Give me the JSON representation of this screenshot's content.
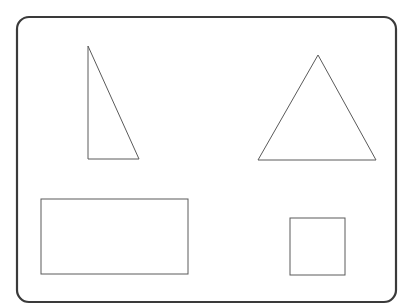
{
  "diagram": {
    "width": 413,
    "height": 308,
    "background": "#ffffff",
    "frame": {
      "x": 17,
      "y": 17,
      "width": 379,
      "height": 285,
      "radius": 12,
      "stroke": "#3a3a3a"
    },
    "shapes": [
      {
        "id": "right-triangle",
        "type": "polygon",
        "points": "88,46 88,159 139,159",
        "stroke": "#5a5a5a"
      },
      {
        "id": "equilateral-triangle",
        "type": "polygon",
        "points": "318,55 258,160 376,160",
        "stroke": "#5a5a5a"
      },
      {
        "id": "rectangle",
        "type": "rect",
        "x": 41,
        "y": 199,
        "width": 147,
        "height": 75,
        "stroke": "#5a5a5a"
      },
      {
        "id": "square",
        "type": "rect",
        "x": 290,
        "y": 218,
        "width": 55,
        "height": 57,
        "stroke": "#5a5a5a"
      }
    ]
  }
}
